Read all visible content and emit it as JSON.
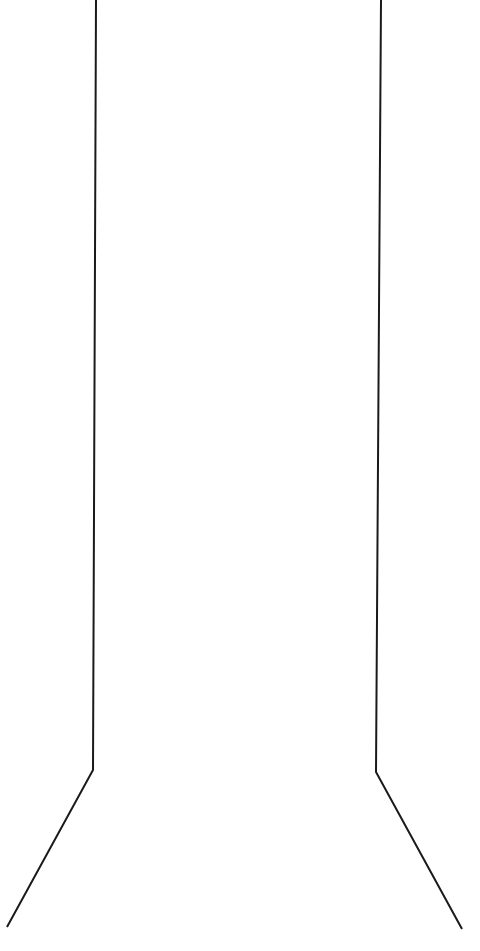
{
  "diagram": {
    "canvas": {
      "width": 480,
      "height": 951,
      "background": "#ffffff"
    },
    "stroke": {
      "color": "#1a1a1a",
      "width": 2
    },
    "shapes": [
      {
        "name": "left-outline",
        "points": [
          [
            96,
            0
          ],
          [
            93,
            770
          ],
          [
            7,
            927
          ]
        ]
      },
      {
        "name": "right-outline",
        "points": [
          [
            381,
            0
          ],
          [
            376,
            772
          ],
          [
            462,
            929
          ]
        ]
      }
    ]
  }
}
